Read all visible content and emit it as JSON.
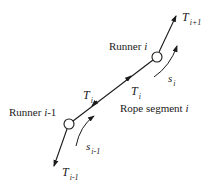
{
  "diagram": {
    "type": "rope-runner-force-diagram",
    "colors": {
      "stroke": "#1a1a1a",
      "background": "#ffffff"
    },
    "labels": {
      "runner_i": {
        "prefix": "Runner ",
        "index": "i"
      },
      "runner_im1": {
        "prefix": "Runner ",
        "index": "i",
        "suffix": "-1"
      },
      "rope_segment": {
        "prefix": "Rope segment ",
        "index": "i"
      },
      "tension_top": {
        "symbol": "T",
        "sub": "i+1"
      },
      "tension_bottom": {
        "symbol": "T",
        "sub": "i-1"
      },
      "tension_mid_left": {
        "symbol": "T",
        "sub": "i"
      },
      "tension_mid_right": {
        "symbol": "T",
        "sub": "i"
      },
      "arc_i": {
        "symbol": "s",
        "sub": "i"
      },
      "arc_im1": {
        "symbol": "s",
        "sub": "i-1"
      }
    },
    "nodes": [
      {
        "name": "runner-i-1",
        "cx": 69,
        "cy": 124,
        "r": 5
      },
      {
        "name": "runner-i",
        "cx": 157,
        "cy": 57,
        "r": 5
      }
    ]
  }
}
